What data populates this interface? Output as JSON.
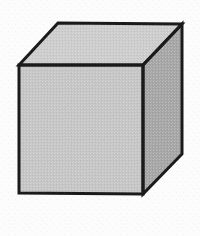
{
  "figure": {
    "caption": "",
    "background_color": "#fcfcfc",
    "outline_color": "#1a1a1a",
    "outline_width": 3,
    "canvas": {
      "width": 200,
      "height": 236
    }
  },
  "geometry": {
    "vertices": {
      "front_top_left": [
        19,
        65
      ],
      "front_top_right": [
        143,
        65
      ],
      "front_bottom_right": [
        143,
        194
      ],
      "front_bottom_left": [
        19,
        193
      ],
      "back_top_left": [
        58,
        23
      ],
      "back_top_right": [
        182,
        24
      ],
      "back_bottom_right": [
        182,
        154
      ]
    },
    "faces": [
      {
        "name": "front-face",
        "label": "Front face",
        "fill": "#c6c6c6",
        "points": "19,65 143,65 143,194 19,193"
      },
      {
        "name": "top-face",
        "label": "Top face",
        "fill": "#cdcdcd",
        "points": "19,65 58,23 182,24 143,65"
      },
      {
        "name": "right-face",
        "label": "Right face",
        "fill": "#a6a6a6",
        "points": "143,65 182,24 182,154 143,194"
      }
    ],
    "edges": [
      {
        "name": "front-top-edge",
        "from": [
          19,
          65
        ],
        "to": [
          143,
          65
        ]
      },
      {
        "name": "front-right-edge",
        "from": [
          143,
          65
        ],
        "to": [
          143,
          194
        ]
      },
      {
        "name": "front-bottom-edge",
        "from": [
          143,
          194
        ],
        "to": [
          19,
          193
        ]
      },
      {
        "name": "front-left-edge",
        "from": [
          19,
          193
        ],
        "to": [
          19,
          65
        ]
      },
      {
        "name": "top-left-edge",
        "from": [
          19,
          65
        ],
        "to": [
          58,
          23
        ]
      },
      {
        "name": "top-back-edge",
        "from": [
          58,
          23
        ],
        "to": [
          182,
          24
        ]
      },
      {
        "name": "right-top-edge",
        "from": [
          182,
          24
        ],
        "to": [
          143,
          65
        ]
      },
      {
        "name": "right-back-edge",
        "from": [
          182,
          24
        ],
        "to": [
          182,
          154
        ]
      },
      {
        "name": "right-bottom-edge",
        "from": [
          182,
          154
        ],
        "to": [
          143,
          194
        ]
      }
    ]
  }
}
